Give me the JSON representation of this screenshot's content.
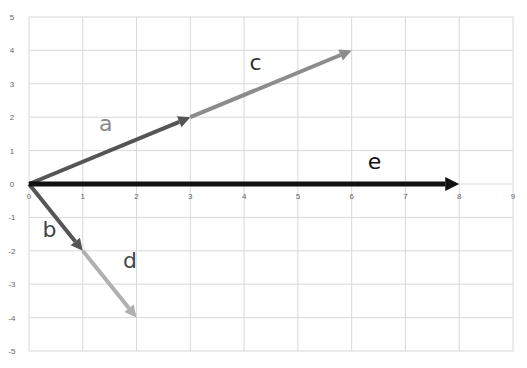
{
  "chart_data": {
    "type": "line",
    "title": "",
    "xlabel": "",
    "ylabel": "",
    "xlim": [
      0,
      9
    ],
    "ylim": [
      -5,
      5
    ],
    "grid": true,
    "legend": "none",
    "x_ticks": [
      "0",
      "1",
      "2",
      "3",
      "4",
      "5",
      "6",
      "7",
      "8",
      "9"
    ],
    "y_ticks": [
      "5",
      "4",
      "3",
      "2",
      "1",
      "0",
      "-1",
      "-2",
      "-3",
      "-4",
      "-5"
    ],
    "series": [
      {
        "name": "a",
        "from": [
          0,
          0
        ],
        "to": [
          3,
          2
        ],
        "color": "#555555",
        "label_pos": [
          1.3,
          1.6
        ],
        "label_color": "#8a8a8a"
      },
      {
        "name": "c",
        "from": [
          3,
          2
        ],
        "to": [
          6,
          4
        ],
        "color": "#8c8c8c",
        "label_pos": [
          4.1,
          3.4
        ],
        "label_color": "#333333"
      },
      {
        "name": "b",
        "from": [
          0,
          0
        ],
        "to": [
          1,
          -2
        ],
        "color": "#555555",
        "label_pos": [
          0.25,
          -1.6
        ],
        "label_color": "#444444"
      },
      {
        "name": "d",
        "from": [
          1,
          -2
        ],
        "to": [
          2,
          -4
        ],
        "color": "#b0b0b0",
        "label_pos": [
          1.75,
          -2.5
        ],
        "label_color": "#444444"
      },
      {
        "name": "e",
        "from": [
          0,
          0
        ],
        "to": [
          8,
          0
        ],
        "color": "#111111",
        "label_pos": [
          6.3,
          0.45
        ],
        "label_color": "#111111"
      }
    ]
  }
}
